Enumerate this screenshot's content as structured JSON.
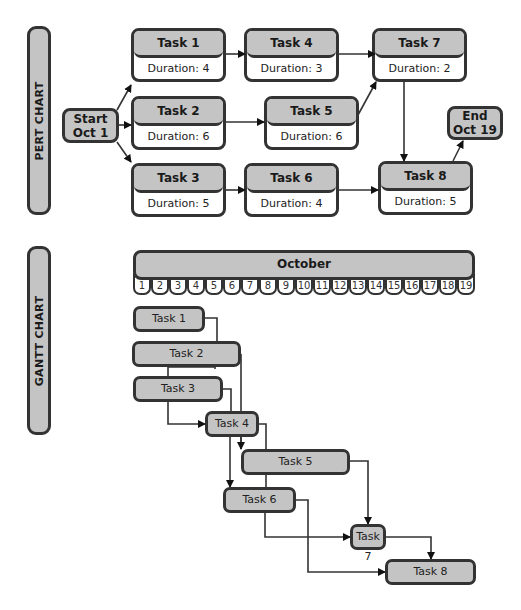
{
  "pert": {
    "side_label": "PERT CHART",
    "start": {
      "line1": "Start",
      "line2": "Oct 1"
    },
    "end": {
      "line1": "End",
      "line2": "Oct 19"
    },
    "tasks": [
      {
        "name": "Task 1",
        "duration": "Duration: 4 days"
      },
      {
        "name": "Task 2",
        "duration": "Duration: 6 days"
      },
      {
        "name": "Task 3",
        "duration": "Duration: 5 days"
      },
      {
        "name": "Task 4",
        "duration": "Duration: 3 days"
      },
      {
        "name": "Task 5",
        "duration": "Duration: 6 days"
      },
      {
        "name": "Task 6",
        "duration": "Duration: 4 days"
      },
      {
        "name": "Task 7",
        "duration": "Duration: 2 days"
      },
      {
        "name": "Task 8",
        "duration": "Duration: 5 days"
      }
    ],
    "dependencies": [
      [
        "Start",
        "Task 1"
      ],
      [
        "Start",
        "Task 2"
      ],
      [
        "Start",
        "Task 3"
      ],
      [
        "Task 1",
        "Task 4"
      ],
      [
        "Task 2",
        "Task 5"
      ],
      [
        "Task 3",
        "Task 6"
      ],
      [
        "Task 4",
        "Task 7"
      ],
      [
        "Task 5",
        "Task 7"
      ],
      [
        "Task 7",
        "Task 8"
      ],
      [
        "Task 6",
        "Task 8"
      ],
      [
        "Task 8",
        "End"
      ]
    ]
  },
  "gantt": {
    "side_label": "GANTT CHART",
    "month": "October",
    "days": [
      "1",
      "2",
      "3",
      "4",
      "5",
      "6",
      "7",
      "8",
      "9",
      "10",
      "11",
      "12",
      "13",
      "14",
      "15",
      "16",
      "17",
      "18",
      "19"
    ],
    "bars": [
      {
        "name": "Task 1",
        "start_day": 1,
        "end_day": 4
      },
      {
        "name": "Task 2",
        "start_day": 1,
        "end_day": 6
      },
      {
        "name": "Task 3",
        "start_day": 1,
        "end_day": 5
      },
      {
        "name": "Task 4",
        "start_day": 5,
        "end_day": 7
      },
      {
        "name": "Task 5",
        "start_day": 7,
        "end_day": 12
      },
      {
        "name": "Task 6",
        "start_day": 6,
        "end_day": 9
      },
      {
        "name": "Task 7",
        "start_day": 13,
        "end_day": 14
      },
      {
        "name": "Task 8",
        "start_day": 15,
        "end_day": 19
      }
    ]
  },
  "colors": {
    "fill": "#c4c4c4",
    "stroke": "#333333",
    "background": "#ffffff"
  }
}
